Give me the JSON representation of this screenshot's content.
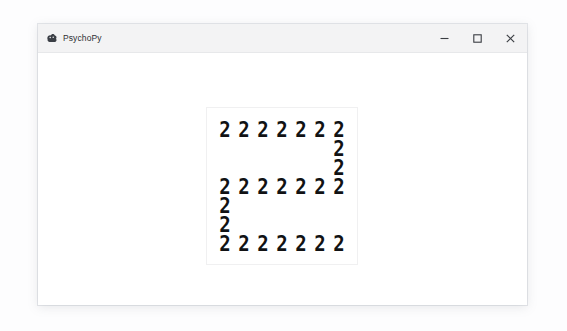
{
  "window": {
    "title": "PsychoPy",
    "app_icon": "psychopy-logo-icon",
    "controls": {
      "minimize_label": "Minimize",
      "minimize_icon": "minimize-icon",
      "maximize_label": "Maximize",
      "maximize_icon": "maximize-icon",
      "close_label": "Close",
      "close_icon": "close-icon"
    }
  },
  "stimulus": {
    "type": "navon-hierarchical-letter",
    "global_letter": "S",
    "local_letter": "2",
    "local_glyph_count": 26,
    "grid_columns": 7,
    "grid_rows": 7,
    "foreground_color": "#111214",
    "background_color": "#ffffff",
    "cells": [
      "2",
      "2",
      "2",
      "2",
      "2",
      "2",
      "2",
      "",
      "",
      "",
      "",
      "",
      "",
      "2",
      "",
      "",
      "",
      "",
      "",
      "",
      "2",
      "2",
      "2",
      "2",
      "2",
      "2",
      "2",
      "2",
      "2",
      "",
      "",
      "",
      "",
      "",
      "",
      "2",
      "",
      "",
      "",
      "",
      "",
      "",
      "2",
      "2",
      "2",
      "2",
      "2",
      "2",
      "2"
    ]
  }
}
